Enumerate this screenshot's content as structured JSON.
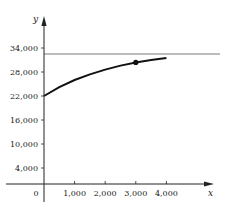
{
  "chart_data": {
    "type": "line",
    "title": "",
    "xlabel": "x",
    "ylabel": "y",
    "x_ticks": [
      0,
      1000,
      2000,
      3000,
      4000
    ],
    "x_tick_labels": [
      "0",
      "1,000",
      "2,000",
      "3,000",
      "4,000"
    ],
    "y_ticks": [
      4000,
      10000,
      16000,
      22000,
      28000,
      34000
    ],
    "y_tick_labels": [
      "4,000",
      "10,000",
      "16,000",
      "22,000",
      "28,000",
      "34,000"
    ],
    "xlim": [
      -1000,
      5500
    ],
    "ylim": [
      0,
      40000
    ],
    "grid": false,
    "legend": null,
    "series": [
      {
        "name": "curve",
        "x": [
          0,
          500,
          1000,
          1500,
          2000,
          2500,
          3000,
          3500,
          4000
        ],
        "y": [
          22000,
          24200,
          26000,
          27400,
          28600,
          29600,
          30400,
          31000,
          31500
        ]
      }
    ],
    "asymptote": {
      "type": "horizontal",
      "y": 32500
    },
    "highlighted_point": {
      "x": 3000,
      "y": 30400
    }
  }
}
